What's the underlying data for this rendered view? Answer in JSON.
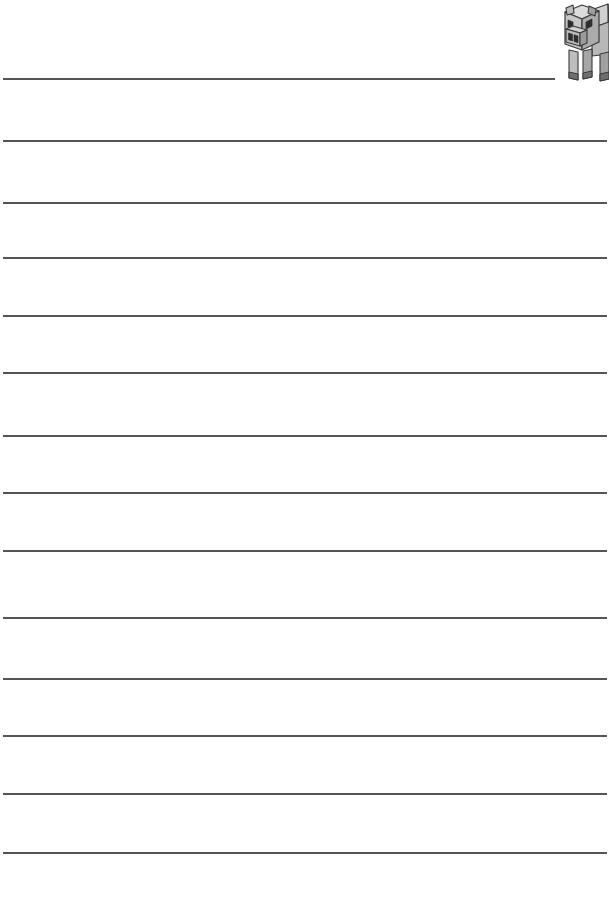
{
  "page": {
    "kind": "lined-writing-worksheet",
    "width": 609,
    "height": 906,
    "background_color": "#ffffff"
  },
  "rules": {
    "line_color": "#555555",
    "line_thickness_px": 2,
    "left_margin_px": 3,
    "right_edge_px": 607,
    "count": 14,
    "lines": [
      {
        "index": 1,
        "y": 78,
        "x_start": 3,
        "x_end": 555,
        "short": true,
        "note": "first line is shortened to clear the illustration"
      },
      {
        "index": 2,
        "y": 140,
        "x_start": 3,
        "x_end": 607,
        "short": false
      },
      {
        "index": 3,
        "y": 202,
        "x_start": 3,
        "x_end": 607,
        "short": false
      },
      {
        "index": 4,
        "y": 257,
        "x_start": 3,
        "x_end": 607,
        "short": false
      },
      {
        "index": 5,
        "y": 315,
        "x_start": 3,
        "x_end": 607,
        "short": false
      },
      {
        "index": 6,
        "y": 372,
        "x_start": 3,
        "x_end": 607,
        "short": false
      },
      {
        "index": 7,
        "y": 435,
        "x_start": 3,
        "x_end": 607,
        "short": false
      },
      {
        "index": 8,
        "y": 492,
        "x_start": 3,
        "x_end": 607,
        "short": false
      },
      {
        "index": 9,
        "y": 550,
        "x_start": 3,
        "x_end": 607,
        "short": false
      },
      {
        "index": 10,
        "y": 617,
        "x_start": 3,
        "x_end": 607,
        "short": false
      },
      {
        "index": 11,
        "y": 678,
        "x_start": 3,
        "x_end": 607,
        "short": false
      },
      {
        "index": 12,
        "y": 735,
        "x_start": 3,
        "x_end": 607,
        "short": false
      },
      {
        "index": 13,
        "y": 793,
        "x_start": 3,
        "x_end": 607,
        "short": false
      },
      {
        "index": 14,
        "y": 852,
        "x_start": 3,
        "x_end": 607,
        "short": false
      }
    ]
  },
  "illustration": {
    "name": "minecraft-pig",
    "subject": "pig",
    "style": "pixel-block isometric line art, grayscale",
    "position": {
      "left": 556,
      "top": 0,
      "width": 53,
      "height": 86
    },
    "colors": {
      "outline": "#3a3a3a",
      "face_light": "#d2d2d2",
      "face_mid": "#b4b4b4",
      "face_dark": "#9a9a9a",
      "body_light": "#c8c8c8",
      "body_mid": "#ababab",
      "body_dark": "#8f8f8f",
      "leg_light": "#c0c0c0",
      "leg_dark": "#8a8a8a",
      "feature_dark": "#2e2e2e",
      "highlight": "#ededed"
    },
    "parts": [
      "head",
      "snout",
      "nostril-left",
      "nostril-right",
      "eye-left",
      "eye-right",
      "ear-left",
      "ear-right",
      "body",
      "front-leg-left",
      "front-leg-right",
      "hind-leg-left",
      "hind-leg-right"
    ]
  }
}
